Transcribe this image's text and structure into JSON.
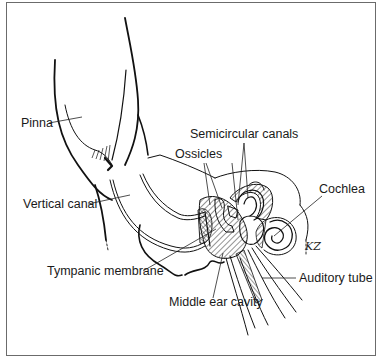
{
  "figure": {
    "type": "anatomical line drawing",
    "signature": "KZ",
    "labels": [
      {
        "id": "pinna",
        "text": "Pinna"
      },
      {
        "id": "semicircular-canals",
        "text": "Semicircular canals"
      },
      {
        "id": "ossicles",
        "text": "Ossicles"
      },
      {
        "id": "cochlea",
        "text": "Cochlea"
      },
      {
        "id": "vertical-canal",
        "text": "Vertical canal"
      },
      {
        "id": "tympanic-membrane",
        "text": "Tympanic membrane"
      },
      {
        "id": "auditory-tube",
        "text": "Auditory tube"
      },
      {
        "id": "middle-ear-cavity",
        "text": "Middle ear cavity"
      }
    ]
  },
  "colors": {
    "ink": "#111111",
    "frame": "#6b6b6b",
    "background": "#ffffff"
  }
}
